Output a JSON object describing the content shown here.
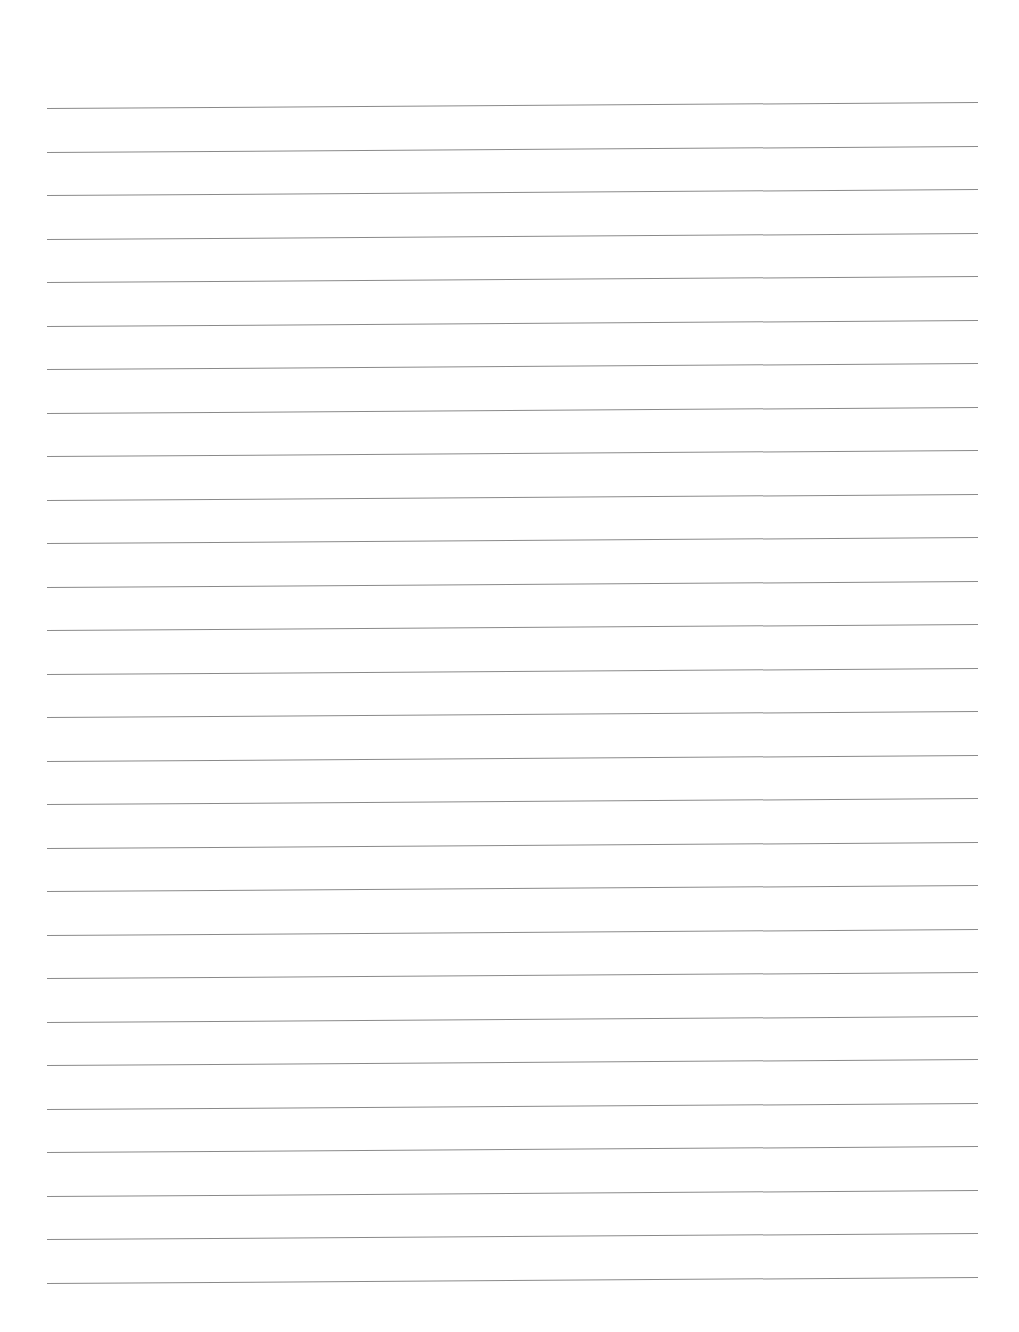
{
  "document": {
    "type": "lined-paper",
    "background_color": "#ffffff",
    "rule_color": "#8a8a8a",
    "rule_count": 28,
    "first_rule_y": 108,
    "rule_spacing": 43.5,
    "text": ""
  }
}
